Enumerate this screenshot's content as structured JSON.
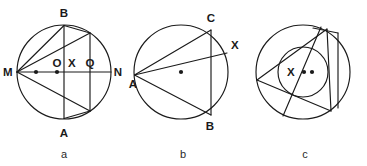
{
  "figure": {
    "type": "geometry-diagram",
    "panel_count": 3,
    "stroke_color": "#1a1a1a",
    "background_color": "#ffffff",
    "panels": [
      {
        "id": "a",
        "caption": "a",
        "description": "Circle with horizontal diameter MN, vertical chord AB through X, second vertical chord through Q, and lines from M",
        "labels": [
          {
            "name": "M",
            "text": "M",
            "x": 8,
            "y": 76
          },
          {
            "name": "N",
            "text": "N",
            "x": 116,
            "y": 76
          },
          {
            "name": "B",
            "text": "B",
            "x": 60,
            "y": 14
          },
          {
            "name": "A",
            "text": "A",
            "x": 60,
            "y": 136
          },
          {
            "name": "O",
            "text": "O",
            "x": 55,
            "y": 66
          },
          {
            "name": "X",
            "text": "X",
            "x": 70,
            "y": 66
          },
          {
            "name": "Q",
            "text": "Q",
            "x": 89,
            "y": 66
          }
        ],
        "dots": [
          {
            "name": "dot-left",
            "x": 36,
            "y": 72
          },
          {
            "name": "dot-center",
            "x": 57,
            "y": 72
          }
        ]
      },
      {
        "id": "b",
        "caption": "b",
        "description": "Circle with inscribed triangle ABC, line from A to X on the circle, vertical chord CB, and center dot",
        "labels": [
          {
            "name": "A",
            "text": "A",
            "x": 8,
            "y": 84
          },
          {
            "name": "C",
            "text": "C",
            "x": 80,
            "y": 20
          },
          {
            "name": "B",
            "text": "B",
            "x": 78,
            "y": 133
          },
          {
            "name": "X",
            "text": "X",
            "x": 104,
            "y": 44
          }
        ],
        "dots": [
          {
            "name": "dot-center",
            "x": 56,
            "y": 72
          }
        ]
      },
      {
        "id": "c",
        "caption": "c",
        "description": "Outer circle containing an inner circle, an inscribed triangle, a crossing chord, labeled point X and two dots",
        "labels": [
          {
            "name": "X",
            "text": "X",
            "x": 44,
            "y": 75
          }
        ],
        "dots": [
          {
            "name": "dot-inner-left",
            "x": 57,
            "y": 72
          },
          {
            "name": "dot-inner-right",
            "x": 65,
            "y": 72
          }
        ]
      }
    ]
  }
}
